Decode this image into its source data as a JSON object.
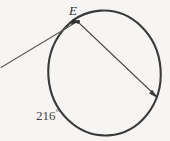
{
  "figure": {
    "kind": "circle-geometry-diagram",
    "background_color": "#f6f5f3",
    "stroke_color": "#3a3a3a",
    "thin_stroke_color": "#55534f",
    "labels": {
      "point_e": "E",
      "arc_measure_value": "216",
      "arc_measure_degree_symbol": "°",
      "arc_measure_full": "216°"
    },
    "geometry": {
      "circle": {
        "center_x": 104.5,
        "center_y": 73,
        "radius": 56.5,
        "stroke_width": 2.0
      },
      "secant_chord": {
        "from_label": "E",
        "from_x": 77.5,
        "from_y": 21.5,
        "to_x": 157,
        "to_y": 97,
        "stroke_width": 1.0,
        "arrow_at_end": true
      },
      "external_ray": {
        "from_x": 1,
        "from_y": 67.5,
        "to_x": 77.5,
        "to_y": 21.5,
        "stroke_width": 1.0,
        "arrow_at_end": false
      },
      "points": [
        {
          "name": "E",
          "x": 77.5,
          "y": 21.5,
          "marker": "dot"
        },
        {
          "name": "secant-endpoint",
          "x": 157,
          "y": 97,
          "marker": "dot"
        }
      ]
    }
  }
}
